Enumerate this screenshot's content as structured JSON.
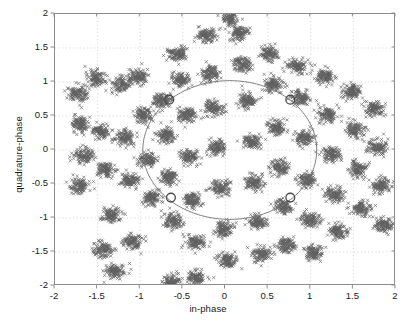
{
  "chart_data": {
    "type": "scatter",
    "title": "",
    "xlabel": "in-phase",
    "ylabel": "quadrature-phase",
    "xlim": [
      -2,
      2
    ],
    "ylim": [
      -2,
      2
    ],
    "xticks": [
      -2,
      -1.5,
      -1,
      -0.5,
      0,
      0.5,
      1,
      1.5,
      2
    ],
    "yticks": [
      -2,
      -1.5,
      -1,
      -0.5,
      0,
      0.5,
      1,
      1.5,
      2
    ],
    "xticklabels": [
      "-2",
      "-1.5",
      "-1",
      "-0.5",
      "0",
      "0.5",
      "1",
      "1.5",
      "2"
    ],
    "yticklabels": [
      "-2",
      "-1.5",
      "-1",
      "-0.5",
      "0",
      "0.5",
      "1",
      "1.5",
      "2"
    ],
    "grid": true,
    "grid_style": "dotted",
    "grid_color": "#c8c8c8",
    "axes_color": "#8c8c8c",
    "legend": null,
    "marker": "x",
    "marker_color": "#606060",
    "marker_size": 3.1,
    "background": "#ffffff",
    "series": [
      {
        "name": "received symbols",
        "marker": "x",
        "color": "#606060",
        "cluster_sigma": 0.055,
        "points_per_cluster": 115,
        "cluster_centers": [
          [
            -1.74,
            0.82
          ],
          [
            -1.7,
            0.38
          ],
          [
            -1.66,
            -0.08
          ],
          [
            -1.7,
            -0.54
          ],
          [
            -1.52,
            1.05
          ],
          [
            -1.46,
            0.28
          ],
          [
            -1.4,
            -0.28
          ],
          [
            -1.34,
            -0.96
          ],
          [
            -1.22,
            0.96
          ],
          [
            -1.18,
            0.18
          ],
          [
            -1.12,
            -0.44
          ],
          [
            -1.1,
            -1.34
          ],
          [
            -1.02,
            1.08
          ],
          [
            -0.96,
            0.52
          ],
          [
            -0.92,
            -0.14
          ],
          [
            -0.86,
            -0.7
          ],
          [
            -1.44,
            -1.46
          ],
          [
            -1.3,
            -1.78
          ],
          [
            -0.74,
            0.74
          ],
          [
            -0.7,
            0.22
          ],
          [
            -0.66,
            -0.4
          ],
          [
            -0.62,
            -1.04
          ],
          [
            -0.56,
            1.42
          ],
          [
            -0.52,
            1.02
          ],
          [
            -0.46,
            0.52
          ],
          [
            -0.42,
            -0.1
          ],
          [
            -0.38,
            -0.74
          ],
          [
            -0.36,
            -1.34
          ],
          [
            -0.34,
            -1.88
          ],
          [
            -0.22,
            1.68
          ],
          [
            -0.18,
            1.12
          ],
          [
            -0.14,
            0.62
          ],
          [
            -0.1,
            0.04
          ],
          [
            -0.06,
            -0.56
          ],
          [
            -0.02,
            -1.16
          ],
          [
            0.02,
            -1.62
          ],
          [
            0.16,
            1.72
          ],
          [
            0.2,
            1.26
          ],
          [
            0.26,
            0.72
          ],
          [
            0.3,
            0.12
          ],
          [
            0.34,
            -0.48
          ],
          [
            0.38,
            -1.06
          ],
          [
            0.42,
            -1.54
          ],
          [
            0.52,
            1.42
          ],
          [
            0.56,
            0.96
          ],
          [
            0.6,
            0.34
          ],
          [
            0.64,
            -0.26
          ],
          [
            0.68,
            -0.84
          ],
          [
            0.72,
            -1.4
          ],
          [
            0.84,
            1.24
          ],
          [
            0.88,
            0.76
          ],
          [
            0.92,
            0.18
          ],
          [
            0.96,
            -0.44
          ],
          [
            1.0,
            -1.02
          ],
          [
            1.04,
            -1.52
          ],
          [
            1.16,
            1.08
          ],
          [
            1.2,
            0.52
          ],
          [
            1.24,
            -0.06
          ],
          [
            1.28,
            -0.66
          ],
          [
            1.32,
            -1.2
          ],
          [
            1.48,
            0.86
          ],
          [
            1.52,
            0.3
          ],
          [
            1.56,
            -0.28
          ],
          [
            1.6,
            -0.86
          ],
          [
            1.74,
            0.6
          ],
          [
            1.78,
            0.04
          ],
          [
            1.82,
            -0.52
          ],
          [
            0.06,
            1.94
          ],
          [
            -0.62,
            -1.94
          ],
          [
            1.86,
            -1.1
          ]
        ]
      },
      {
        "name": "phase trajectory",
        "type": "line",
        "color": "#707070",
        "shape": "circle",
        "radius": 1.02,
        "center": [
          0.05,
          0.0
        ]
      },
      {
        "name": "trajectory markers",
        "type": "circle-markers",
        "color": "#4a4a4a",
        "points": [
          [
            -0.66,
            0.74
          ],
          [
            0.76,
            0.74
          ],
          [
            -0.64,
            -0.7
          ],
          [
            0.76,
            -0.7
          ]
        ]
      }
    ]
  },
  "axes": {
    "x_label": "in-phase",
    "y_label": "quadrature-phase"
  }
}
